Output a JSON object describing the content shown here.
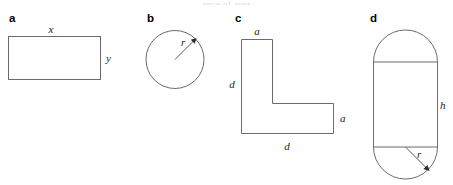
{
  "figure": {
    "width": 453,
    "height": 185,
    "background_color": "#ffffff",
    "stroke_color": "#6b6b6b",
    "label_color": "#1a1a1a",
    "cropped_caption_fragment": "ance of area",
    "panels": [
      {
        "key": "a",
        "letter": "a",
        "shape": "rectangle",
        "labels": [
          {
            "name": "width-label",
            "text": "x"
          },
          {
            "name": "height-label",
            "text": "y"
          }
        ]
      },
      {
        "key": "b",
        "letter": "b",
        "shape": "circle",
        "labels": [
          {
            "name": "radius-label",
            "text": "r"
          }
        ]
      },
      {
        "key": "c",
        "letter": "c",
        "shape": "l-shape",
        "labels": [
          {
            "name": "top-arm-label",
            "text": "a"
          },
          {
            "name": "left-side-label",
            "text": "d"
          },
          {
            "name": "right-arm-label",
            "text": "a"
          },
          {
            "name": "bottom-side-label",
            "text": "d"
          }
        ]
      },
      {
        "key": "d",
        "letter": "d",
        "shape": "stadium",
        "labels": [
          {
            "name": "height-label",
            "text": "h"
          },
          {
            "name": "radius-label",
            "text": "r"
          }
        ]
      }
    ]
  }
}
